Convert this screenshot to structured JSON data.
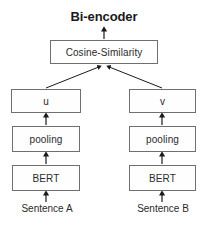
{
  "diagram": {
    "title": "Bi-encoder",
    "type": "flowchart",
    "orientation": "bottom-to-top",
    "colors": {
      "background": "#ffffff",
      "box_fill": "#fefefe",
      "box_border": "#6f6f6f",
      "text": "#2b2b2b",
      "title_text": "#1a1a1a",
      "arrow": "#1a1a1a"
    },
    "nodes": {
      "cosine": "Cosine-Similarity",
      "left": {
        "vector": "u",
        "pooling": "pooling",
        "encoder": "BERT",
        "input": "Sentence A"
      },
      "right": {
        "vector": "v",
        "pooling": "pooling",
        "encoder": "BERT",
        "input": "Sentence B"
      }
    },
    "edges": [
      {
        "from": "Sentence A",
        "to": "BERT",
        "style": "straight-vertical-arrow"
      },
      {
        "from": "BERT",
        "to": "pooling",
        "style": "straight-vertical-arrow"
      },
      {
        "from": "pooling",
        "to": "u",
        "style": "straight-vertical-arrow"
      },
      {
        "from": "u",
        "to": "Cosine-Similarity",
        "style": "diagonal-arrow"
      },
      {
        "from": "Sentence B",
        "to": "BERT",
        "style": "straight-vertical-arrow"
      },
      {
        "from": "BERT",
        "to": "pooling",
        "style": "straight-vertical-arrow"
      },
      {
        "from": "pooling",
        "to": "v",
        "style": "straight-vertical-arrow"
      },
      {
        "from": "v",
        "to": "Cosine-Similarity",
        "style": "diagonal-arrow"
      },
      {
        "from": "Cosine-Similarity",
        "to": "Bi-encoder",
        "style": "straight-vertical-arrow"
      }
    ]
  }
}
